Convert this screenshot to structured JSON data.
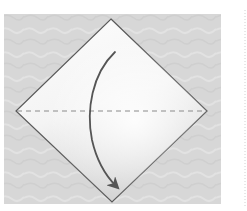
{
  "diagram": {
    "type": "origami-fold-step",
    "colors": {
      "page_background": "#ffffff",
      "backdrop": "#d6d6d6",
      "paper_light": "#fbfbfb",
      "paper_shade": "#d8d8d8",
      "outline": "#5a5a5a",
      "fold_line": "#8a8a8a",
      "arrow": "#555555",
      "right_margin_dots": "#d0d0d0"
    },
    "elements": {
      "backdrop": {
        "x": 4,
        "y": 14,
        "width": 217,
        "height": 190
      },
      "paper_diamond": {
        "top": [
          111,
          19
        ],
        "right": [
          207,
          111
        ],
        "bottom": [
          112,
          202
        ],
        "left": [
          16,
          111
        ]
      },
      "valley_fold_line": {
        "x1": 16,
        "y1": 111,
        "x2": 207,
        "y2": 111,
        "style": "dashed"
      },
      "fold_arrow": {
        "from": [
          115,
          52
        ],
        "to": [
          118,
          188
        ],
        "direction": "down",
        "curve": "bulges-left"
      }
    }
  }
}
